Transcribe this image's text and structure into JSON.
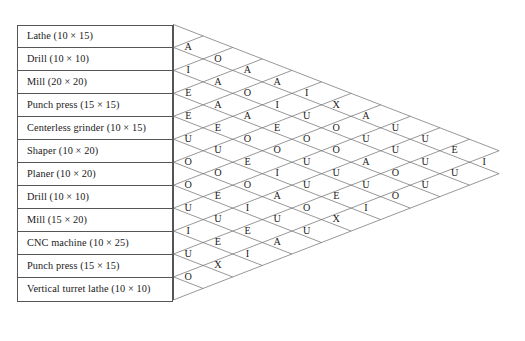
{
  "chart_type": "activity-relationship-chart",
  "activities": [
    {
      "index": 1,
      "name": "Lathe",
      "size": "(10 × 15)"
    },
    {
      "index": 2,
      "name": "Drill",
      "size": "(10 × 10)"
    },
    {
      "index": 3,
      "name": "Mill",
      "size": "(20 × 20)"
    },
    {
      "index": 4,
      "name": "Punch press",
      "size": "(15 × 15)"
    },
    {
      "index": 5,
      "name": "Centerless grinder",
      "size": "(10 × 15)"
    },
    {
      "index": 6,
      "name": "Shaper",
      "size": "(10 × 20)"
    },
    {
      "index": 7,
      "name": "Planer",
      "size": "(10 × 20)"
    },
    {
      "index": 8,
      "name": "Drill",
      "size": "(10 × 10)"
    },
    {
      "index": 9,
      "name": "Mill",
      "size": "(15 × 20)"
    },
    {
      "index": 10,
      "name": "CNC machine",
      "size": "(10 × 25)"
    },
    {
      "index": 11,
      "name": "Punch press",
      "size": "(15 × 15)"
    },
    {
      "index": 12,
      "name": "Vertical turret lathe",
      "size": "(10 × 10)"
    }
  ],
  "activity_labels": [
    "Lathe (10 × 15)",
    "Drill (10 × 10)",
    "Mill (20 × 20)",
    "Punch press (15 × 15)",
    "Centerless grinder (10 × 15)",
    "Shaper (10 × 20)",
    "Planer (10 × 20)",
    "Drill (10 × 10)",
    "Mill (15 × 20)",
    "CNC machine (10 × 25)",
    "Punch press (15 × 15)",
    "Vertical turret lathe (10 × 10)"
  ],
  "rating_codes": [
    "A",
    "E",
    "I",
    "O",
    "U",
    "X"
  ],
  "relationship_columns": [
    {
      "column": 1,
      "pair_offset": 1,
      "values": [
        "A",
        "I",
        "E",
        "E",
        "U",
        "O",
        "O",
        "U",
        "I",
        "U",
        "O"
      ]
    },
    {
      "column": 2,
      "pair_offset": 2,
      "values": [
        "O",
        "A",
        "A",
        "E",
        "U",
        "O",
        "E",
        "U",
        "E",
        "X"
      ]
    },
    {
      "column": 3,
      "pair_offset": 3,
      "values": [
        "A",
        "O",
        "A",
        "O",
        "E",
        "O",
        "I",
        "E",
        "I"
      ]
    },
    {
      "column": 4,
      "pair_offset": 4,
      "values": [
        "A",
        "I",
        "E",
        "O",
        "I",
        "A",
        "U",
        "A"
      ]
    },
    {
      "column": 5,
      "pair_offset": 5,
      "values": [
        "I",
        "U",
        "O",
        "U",
        "U",
        "O",
        "U"
      ]
    },
    {
      "column": 6,
      "pair_offset": 6,
      "values": [
        "X",
        "O",
        "O",
        "U",
        "E",
        "X"
      ]
    },
    {
      "column": 7,
      "pair_offset": 7,
      "values": [
        "A",
        "U",
        "A",
        "U",
        "I"
      ]
    },
    {
      "column": 8,
      "pair_offset": 8,
      "values": [
        "U",
        "U",
        "O",
        "O"
      ]
    },
    {
      "column": 9,
      "pair_offset": 9,
      "values": [
        "U",
        "U",
        "U"
      ]
    },
    {
      "column": 10,
      "pair_offset": 10,
      "values": [
        "E",
        "U"
      ]
    },
    {
      "column": 11,
      "pair_offset": 11,
      "values": [
        "I"
      ]
    }
  ],
  "chart_data": {
    "type": "table",
    "categories": [
      "Lathe (10 × 15)",
      "Drill (10 × 10)",
      "Mill (20 × 20)",
      "Punch press (15 × 15)",
      "Centerless grinder (10 × 15)",
      "Shaper (10 × 20)",
      "Planer (10 × 20)",
      "Drill (10 × 10)",
      "Mill (15 × 20)",
      "CNC machine (10 × 25)",
      "Punch press (15 × 15)",
      "Vertical turret lathe (10 × 10)"
    ],
    "value_domain": [
      "A",
      "E",
      "I",
      "O",
      "U",
      "X"
    ],
    "diagonals": [
      [
        "A",
        "I",
        "E",
        "E",
        "U",
        "O",
        "O",
        "U",
        "I",
        "U",
        "O"
      ],
      [
        "O",
        "A",
        "A",
        "E",
        "U",
        "O",
        "E",
        "U",
        "E",
        "X"
      ],
      [
        "A",
        "O",
        "A",
        "O",
        "E",
        "O",
        "I",
        "E",
        "I"
      ],
      [
        "A",
        "I",
        "E",
        "O",
        "I",
        "A",
        "U",
        "A"
      ],
      [
        "I",
        "U",
        "O",
        "U",
        "U",
        "O",
        "U"
      ],
      [
        "X",
        "O",
        "O",
        "U",
        "E",
        "X"
      ],
      [
        "A",
        "U",
        "A",
        "U",
        "I"
      ],
      [
        "U",
        "U",
        "O",
        "O"
      ],
      [
        "U",
        "U",
        "U"
      ],
      [
        "E",
        "U"
      ],
      [
        "I"
      ]
    ],
    "pairs": [
      {
        "i": 1,
        "j": 2,
        "v": "A"
      },
      {
        "i": 2,
        "j": 3,
        "v": "I"
      },
      {
        "i": 3,
        "j": 4,
        "v": "E"
      },
      {
        "i": 4,
        "j": 5,
        "v": "E"
      },
      {
        "i": 5,
        "j": 6,
        "v": "U"
      },
      {
        "i": 6,
        "j": 7,
        "v": "O"
      },
      {
        "i": 7,
        "j": 8,
        "v": "O"
      },
      {
        "i": 8,
        "j": 9,
        "v": "U"
      },
      {
        "i": 9,
        "j": 10,
        "v": "I"
      },
      {
        "i": 10,
        "j": 11,
        "v": "U"
      },
      {
        "i": 11,
        "j": 12,
        "v": "O"
      },
      {
        "i": 1,
        "j": 3,
        "v": "O"
      },
      {
        "i": 2,
        "j": 4,
        "v": "A"
      },
      {
        "i": 3,
        "j": 5,
        "v": "A"
      },
      {
        "i": 4,
        "j": 6,
        "v": "E"
      },
      {
        "i": 5,
        "j": 7,
        "v": "U"
      },
      {
        "i": 6,
        "j": 8,
        "v": "O"
      },
      {
        "i": 7,
        "j": 9,
        "v": "E"
      },
      {
        "i": 8,
        "j": 10,
        "v": "U"
      },
      {
        "i": 9,
        "j": 11,
        "v": "E"
      },
      {
        "i": 10,
        "j": 12,
        "v": "X"
      },
      {
        "i": 1,
        "j": 4,
        "v": "A"
      },
      {
        "i": 2,
        "j": 5,
        "v": "O"
      },
      {
        "i": 3,
        "j": 6,
        "v": "A"
      },
      {
        "i": 4,
        "j": 7,
        "v": "O"
      },
      {
        "i": 5,
        "j": 8,
        "v": "E"
      },
      {
        "i": 6,
        "j": 9,
        "v": "O"
      },
      {
        "i": 7,
        "j": 10,
        "v": "I"
      },
      {
        "i": 8,
        "j": 11,
        "v": "E"
      },
      {
        "i": 9,
        "j": 12,
        "v": "I"
      },
      {
        "i": 1,
        "j": 5,
        "v": "A"
      },
      {
        "i": 2,
        "j": 6,
        "v": "I"
      },
      {
        "i": 3,
        "j": 7,
        "v": "E"
      },
      {
        "i": 4,
        "j": 8,
        "v": "O"
      },
      {
        "i": 5,
        "j": 9,
        "v": "I"
      },
      {
        "i": 6,
        "j": 10,
        "v": "A"
      },
      {
        "i": 7,
        "j": 11,
        "v": "U"
      },
      {
        "i": 8,
        "j": 12,
        "v": "A"
      },
      {
        "i": 1,
        "j": 6,
        "v": "I"
      },
      {
        "i": 2,
        "j": 7,
        "v": "U"
      },
      {
        "i": 3,
        "j": 8,
        "v": "O"
      },
      {
        "i": 4,
        "j": 9,
        "v": "U"
      },
      {
        "i": 5,
        "j": 10,
        "v": "U"
      },
      {
        "i": 6,
        "j": 11,
        "v": "O"
      },
      {
        "i": 7,
        "j": 12,
        "v": "U"
      },
      {
        "i": 1,
        "j": 7,
        "v": "X"
      },
      {
        "i": 2,
        "j": 8,
        "v": "O"
      },
      {
        "i": 3,
        "j": 9,
        "v": "O"
      },
      {
        "i": 4,
        "j": 10,
        "v": "U"
      },
      {
        "i": 5,
        "j": 11,
        "v": "E"
      },
      {
        "i": 6,
        "j": 12,
        "v": "X"
      },
      {
        "i": 1,
        "j": 8,
        "v": "A"
      },
      {
        "i": 2,
        "j": 9,
        "v": "U"
      },
      {
        "i": 3,
        "j": 10,
        "v": "A"
      },
      {
        "i": 4,
        "j": 11,
        "v": "U"
      },
      {
        "i": 5,
        "j": 12,
        "v": "I"
      },
      {
        "i": 1,
        "j": 9,
        "v": "U"
      },
      {
        "i": 2,
        "j": 10,
        "v": "U"
      },
      {
        "i": 3,
        "j": 11,
        "v": "O"
      },
      {
        "i": 4,
        "j": 12,
        "v": "O"
      },
      {
        "i": 1,
        "j": 10,
        "v": "U"
      },
      {
        "i": 2,
        "j": 11,
        "v": "U"
      },
      {
        "i": 3,
        "j": 12,
        "v": "U"
      },
      {
        "i": 1,
        "j": 11,
        "v": "E"
      },
      {
        "i": 2,
        "j": 12,
        "v": "U"
      },
      {
        "i": 1,
        "j": 12,
        "v": "I"
      }
    ],
    "grid": true,
    "legend": null,
    "xlabel": "",
    "ylabel": ""
  },
  "colors": {
    "line": "#6b6b6b",
    "border": "#555555",
    "text": "#1a1a1a",
    "background": "#ffffff"
  }
}
